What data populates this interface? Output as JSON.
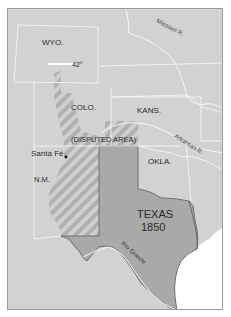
{
  "map": {
    "colors": {
      "background": "#d2d2d2",
      "texas": "#a9a9a9",
      "texas_border": "#6e6e6e",
      "water": "#ffffff",
      "state_lines": "#f2f2f2",
      "hatch": "#b0b0b0",
      "frame": "#9a9a9a"
    },
    "labels": {
      "wyo": "WYO.",
      "colo": "COLO.",
      "kans": "KANS.",
      "okla": "OKLA.",
      "nm": "N.M.",
      "texas_line1": "TEXAS",
      "texas_line2": "1850",
      "disputed": "(DISPUTED AREA)",
      "santa_fe": "Santa Fé",
      "parallel": "42°"
    },
    "rivers": {
      "missouri": "Missouri R.",
      "arkansas": "Arkansas R.",
      "rio_grande": "Rio Grande"
    }
  }
}
